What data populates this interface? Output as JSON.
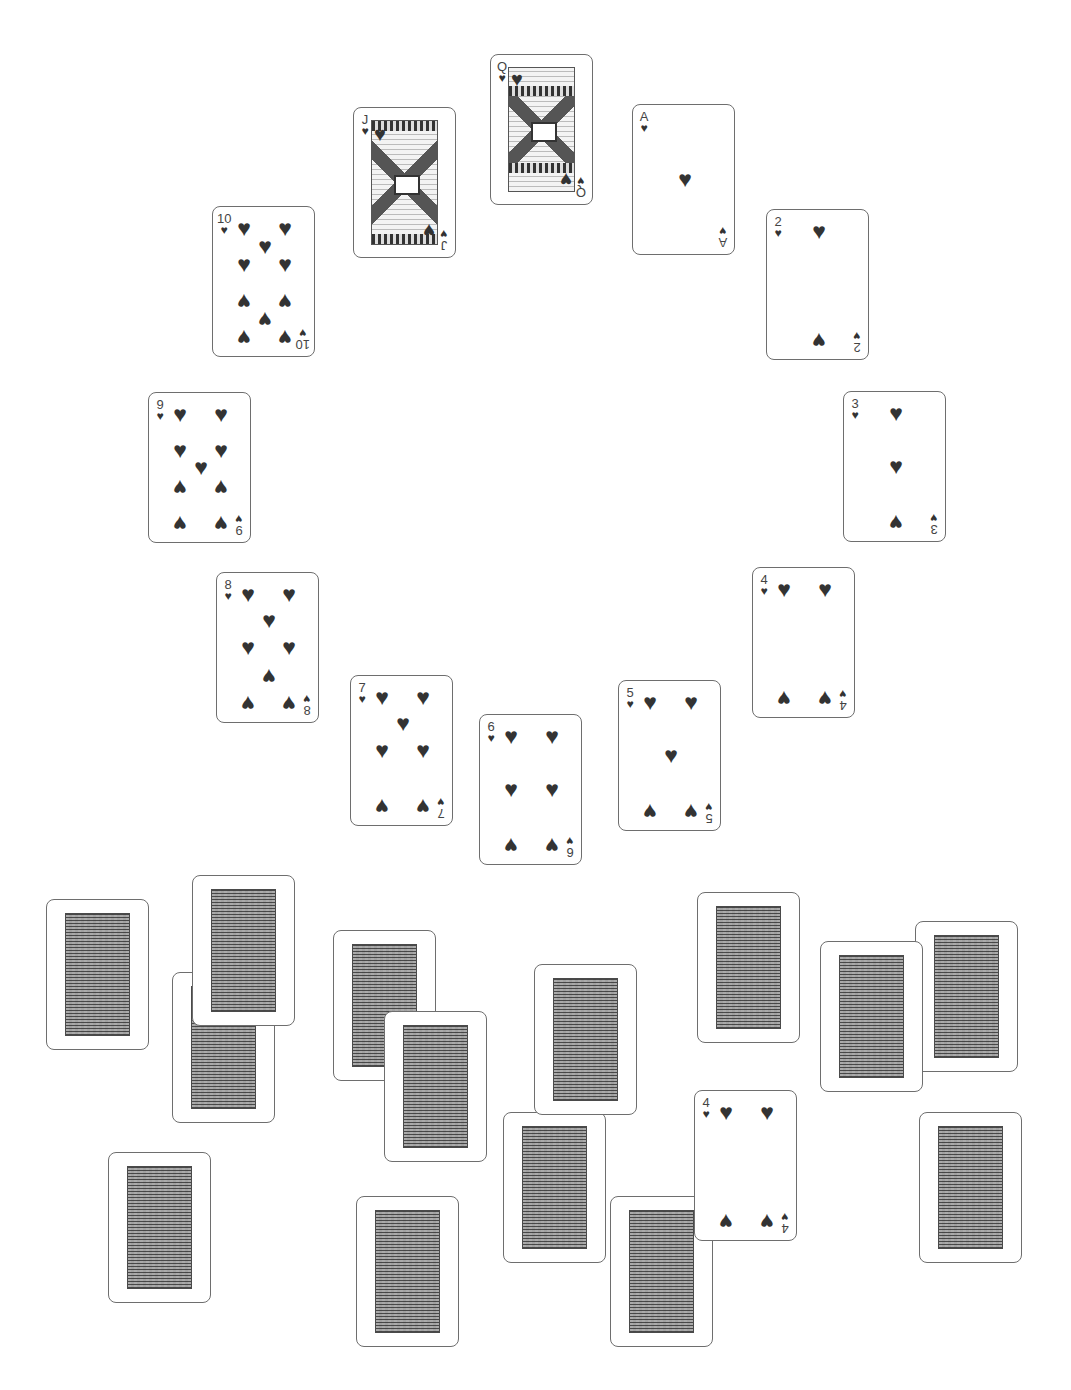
{
  "game": {
    "type": "clock-solitaire",
    "suit_symbol": "♥",
    "colors": {
      "ink": "#333333",
      "card_border": "#6e6e6e",
      "card_back": "#8a8a8a",
      "background": "#ffffff"
    }
  },
  "clock_ring": [
    {
      "rank": "Q",
      "suit": "hearts",
      "x": 490,
      "y": 54
    },
    {
      "rank": "J",
      "suit": "hearts",
      "x": 353,
      "y": 107
    },
    {
      "rank": "A",
      "suit": "hearts",
      "x": 632,
      "y": 104
    },
    {
      "rank": "10",
      "suit": "hearts",
      "x": 212,
      "y": 206
    },
    {
      "rank": "2",
      "suit": "hearts",
      "x": 766,
      "y": 209
    },
    {
      "rank": "9",
      "suit": "hearts",
      "x": 148,
      "y": 392
    },
    {
      "rank": "3",
      "suit": "hearts",
      "x": 843,
      "y": 391
    },
    {
      "rank": "8",
      "suit": "hearts",
      "x": 216,
      "y": 572
    },
    {
      "rank": "4",
      "suit": "hearts",
      "x": 752,
      "y": 567
    },
    {
      "rank": "7",
      "suit": "hearts",
      "x": 350,
      "y": 675
    },
    {
      "rank": "5",
      "suit": "hearts",
      "x": 618,
      "y": 680
    },
    {
      "rank": "6",
      "suit": "hearts",
      "x": 479,
      "y": 714
    }
  ],
  "pile_area": {
    "face_down_count": 14,
    "face_down": [
      {
        "x": 46,
        "y": 899
      },
      {
        "x": 172,
        "y": 972
      },
      {
        "x": 192,
        "y": 875
      },
      {
        "x": 333,
        "y": 930
      },
      {
        "x": 384,
        "y": 1011
      },
      {
        "x": 534,
        "y": 964
      },
      {
        "x": 503,
        "y": 1112
      },
      {
        "x": 697,
        "y": 892
      },
      {
        "x": 915,
        "y": 921
      },
      {
        "x": 820,
        "y": 941
      },
      {
        "x": 919,
        "y": 1112
      },
      {
        "x": 108,
        "y": 1152
      },
      {
        "x": 356,
        "y": 1196
      },
      {
        "x": 610,
        "y": 1196
      }
    ],
    "face_up": [
      {
        "rank": "4",
        "suit": "hearts",
        "x": 694,
        "y": 1090
      }
    ]
  }
}
